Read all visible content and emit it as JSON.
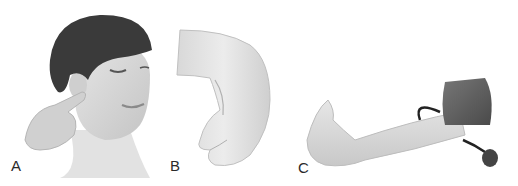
{
  "figure": {
    "panels": [
      {
        "label": "A",
        "subject": "woman with one eye closed, finger pressed in front of ear (tragus)"
      },
      {
        "label": "B",
        "subject": "hand flexed at wrist (Phalen-like position)"
      },
      {
        "label": "C",
        "subject": "arm with blood pressure cuff inflated, hand in spasm (Trousseau sign)"
      }
    ],
    "colors": {
      "background": "#ffffff",
      "hair": "#3a3a3a",
      "skin": "#dcdcdc",
      "cuff": "#5a5a5a",
      "label": "#2a2a2a"
    }
  }
}
